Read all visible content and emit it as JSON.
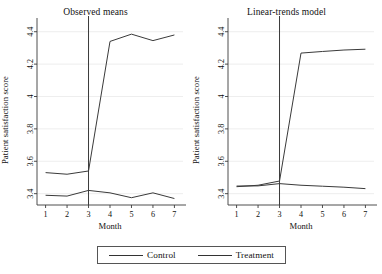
{
  "figure": {
    "y_axis_title": "Patient satisfaction score",
    "x_axis_title": "Month",
    "legend": {
      "items": [
        {
          "label": "Control",
          "color": "#333333"
        },
        {
          "label": "Treatment",
          "color": "#333333"
        }
      ]
    }
  },
  "chart_data": [
    {
      "type": "line",
      "title": "Observed means",
      "xlabel": "Month",
      "ylabel": "Patient satisfaction score",
      "x": [
        1,
        2,
        3,
        4,
        5,
        6,
        7
      ],
      "xticklabels": [
        "1",
        "2",
        "3",
        "4",
        "5",
        "6",
        "7"
      ],
      "xlim": [
        0.6,
        7.4
      ],
      "yticklabels": [
        "3.4",
        "3.6",
        "3.8",
        "4",
        "4.2",
        "4.4"
      ],
      "yticks": [
        3.4,
        3.6,
        3.8,
        4.0,
        4.2,
        4.4
      ],
      "ylim": [
        3.33,
        4.46
      ],
      "grid": "horizontal",
      "legend_position": "below-figure",
      "annotations": [
        {
          "type": "vertical-line",
          "x": 3,
          "label": "intervention"
        }
      ],
      "series": [
        {
          "name": "Control",
          "values": [
            3.39,
            3.385,
            3.42,
            3.405,
            3.375,
            3.405,
            3.37
          ]
        },
        {
          "name": "Treatment",
          "values": [
            3.53,
            3.52,
            3.54,
            4.34,
            4.385,
            4.345,
            4.38
          ]
        }
      ]
    },
    {
      "type": "line",
      "title": "Linear-trends model",
      "xlabel": "Month",
      "ylabel": "Patient satisfaction score",
      "x": [
        1,
        2,
        3,
        4,
        5,
        6,
        7
      ],
      "xticklabels": [
        "1",
        "2",
        "3",
        "4",
        "5",
        "6",
        "7"
      ],
      "xlim": [
        0.6,
        7.4
      ],
      "yticklabels": [
        "3.4",
        "3.6",
        "3.8",
        "4",
        "4.2",
        "4.4"
      ],
      "yticks": [
        3.4,
        3.6,
        3.8,
        4.0,
        4.2,
        4.4
      ],
      "ylim": [
        3.33,
        4.46
      ],
      "grid": "horizontal",
      "legend_position": "below-figure",
      "annotations": [
        {
          "type": "vertical-line",
          "x": 3,
          "label": "intervention"
        }
      ],
      "series": [
        {
          "name": "Control",
          "values": [
            3.447,
            3.448,
            3.462,
            3.452,
            3.446,
            3.44,
            3.431
          ]
        },
        {
          "name": "Treatment",
          "values": [
            3.443,
            3.452,
            3.478,
            4.268,
            4.278,
            4.287,
            4.292
          ]
        }
      ]
    }
  ]
}
